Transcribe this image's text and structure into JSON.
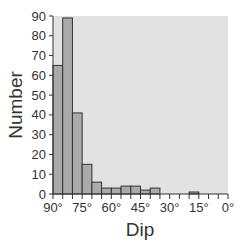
{
  "chart_data": {
    "type": "bar",
    "subtype": "histogram",
    "title": "",
    "xlabel": "Dip",
    "ylabel": "Number",
    "x_reversed": true,
    "xlim": [
      90,
      0
    ],
    "ylim": [
      0,
      90
    ],
    "bin_width": 5,
    "bin_edges": [
      90,
      85,
      80,
      75,
      70,
      65,
      60,
      55,
      50,
      45,
      40,
      35,
      30,
      25,
      20,
      15,
      10,
      5,
      0
    ],
    "categories": [
      "90-85",
      "85-80",
      "80-75",
      "75-70",
      "70-65",
      "65-60",
      "60-55",
      "55-50",
      "50-45",
      "45-40",
      "40-35",
      "35-30",
      "30-25",
      "25-20",
      "20-15",
      "15-10",
      "10-5",
      "5-0"
    ],
    "values": [
      65,
      89,
      41,
      15,
      6,
      3,
      3,
      4,
      4,
      2,
      3,
      0,
      0,
      0,
      1,
      0,
      0,
      0
    ],
    "x_ticks": [
      "90°",
      "75°",
      "60°",
      "45°",
      "30°",
      "15°",
      "0°"
    ],
    "y_ticks": [
      "0",
      "10",
      "20",
      "30",
      "40",
      "50",
      "60",
      "70",
      "80",
      "90"
    ],
    "grid": false,
    "legend": null,
    "colors": {
      "plot_background": "#e2e2e2",
      "bar_fill": "#aaaaaa",
      "bar_stroke": "#333333",
      "axis": "#333333"
    }
  }
}
